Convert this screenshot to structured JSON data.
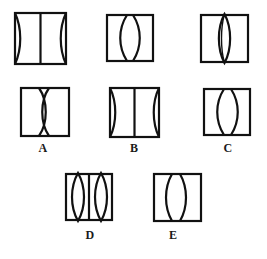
{
  "figure": {
    "title": "",
    "stroke_color": "#111111",
    "fill_color": "#ffffff",
    "background_color": "#ffffff",
    "stroke_width": 2.2,
    "canvas": {
      "width": 267,
      "height": 259
    }
  },
  "labels": [
    {
      "id": "A",
      "text": "A"
    },
    {
      "id": "B",
      "text": "B"
    },
    {
      "id": "C",
      "text": "C"
    },
    {
      "id": "D",
      "text": "D"
    },
    {
      "id": "E",
      "text": "E"
    }
  ],
  "panels": [
    {
      "id": "panel-top-left",
      "row": 1,
      "column": 1,
      "label": "",
      "box": {
        "x": 15,
        "y": 13,
        "width": 51,
        "height": 51
      },
      "content": "Straight vertical center line; left and right edges each bowed inward toward the center (concave sides).",
      "elements": [
        {
          "kind": "straight-line",
          "position": "center"
        },
        {
          "kind": "curve",
          "position": "left-edge",
          "bow": "inward"
        },
        {
          "kind": "curve",
          "position": "right-edge",
          "bow": "inward"
        }
      ]
    },
    {
      "id": "panel-top-middle",
      "row": 1,
      "column": 2,
      "label": "",
      "box": {
        "x": 107,
        "y": 15,
        "width": 46,
        "height": 46
      },
      "content": "Two curves bowed away from each other leaving a narrow straight gap in the middle.",
      "elements": [
        {
          "kind": "curve",
          "position": "left-of-center",
          "bow": "left"
        },
        {
          "kind": "curve",
          "position": "right-of-center",
          "bow": "right"
        }
      ]
    },
    {
      "id": "panel-top-right",
      "row": 1,
      "column": 3,
      "label": "",
      "box": {
        "x": 201,
        "y": 15,
        "width": 47,
        "height": 47
      },
      "content": "A single narrow vertical lens (pointed oval) centered in the panel.",
      "elements": [
        {
          "kind": "lens",
          "position": "center",
          "width": "narrow"
        }
      ]
    },
    {
      "id": "panel-mid-left",
      "row": 2,
      "column": 1,
      "label": "A",
      "box": {
        "x": 21,
        "y": 88,
        "width": 48,
        "height": 48
      },
      "content": "Hourglass: two curves crossing and pinching at the centre of the panel.",
      "elements": [
        {
          "kind": "hourglass",
          "position": "center"
        }
      ]
    },
    {
      "id": "panel-mid-middle",
      "row": 2,
      "column": 2,
      "label": "B",
      "box": {
        "x": 110,
        "y": 88,
        "width": 49,
        "height": 49
      },
      "content": "Straight vertical center line; left and right edges each bowed inward.",
      "elements": [
        {
          "kind": "straight-line",
          "position": "center"
        },
        {
          "kind": "curve",
          "position": "left-edge",
          "bow": "inward"
        },
        {
          "kind": "curve",
          "position": "right-edge",
          "bow": "inward"
        }
      ]
    },
    {
      "id": "panel-mid-right",
      "row": 2,
      "column": 3,
      "label": "C",
      "box": {
        "x": 204,
        "y": 89,
        "width": 46,
        "height": 46
      },
      "content": "Two curves bowed away from each other leaving a straight gap in the middle.",
      "elements": [
        {
          "kind": "curve",
          "position": "left-of-center",
          "bow": "left"
        },
        {
          "kind": "curve",
          "position": "right-of-center",
          "bow": "right"
        }
      ]
    },
    {
      "id": "panel-bottom-left",
      "row": 3,
      "column": 1,
      "label": "D",
      "box": {
        "x": 66,
        "y": 174,
        "width": 46,
        "height": 46
      },
      "content": "Two narrow vertical lenses separated by a straight vertical line.",
      "elements": [
        {
          "kind": "lens",
          "position": "left",
          "width": "narrow"
        },
        {
          "kind": "straight-line",
          "position": "center"
        },
        {
          "kind": "lens",
          "position": "right",
          "width": "narrow"
        }
      ]
    },
    {
      "id": "panel-bottom-middle",
      "row": 3,
      "column": 2,
      "label": "E",
      "box": {
        "x": 154,
        "y": 174,
        "width": 47,
        "height": 47
      },
      "content": "Two curves bowed away from each other leaving a straight gap in the middle.",
      "elements": [
        {
          "kind": "curve",
          "position": "left-of-center",
          "bow": "left"
        },
        {
          "kind": "curve",
          "position": "right-of-center",
          "bow": "right"
        }
      ]
    }
  ]
}
